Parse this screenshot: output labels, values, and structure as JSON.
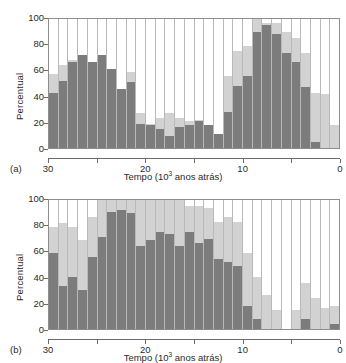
{
  "figure": {
    "panels": [
      {
        "tag": "(a)"
      },
      {
        "tag": "(b)"
      }
    ]
  },
  "axis": {
    "ylabel": "Percentual",
    "yticks": [
      "0",
      "20",
      "40",
      "60",
      "80",
      "100"
    ],
    "xticks": [
      "30",
      "25",
      "20",
      "15",
      "10",
      "5",
      "0"
    ],
    "xtick_labeled": [
      "30",
      "",
      "20",
      "",
      "10",
      "",
      "0"
    ],
    "xlabel_prefix": "Tempo (10",
    "xlabel_sup": "3",
    "xlabel_suffix": " anos atrás)"
  },
  "colors": {
    "dark_gray": "#7c7c7c",
    "light_gray": "#d2d2d2",
    "background": "#ffffff",
    "axis": "#6b6b6b",
    "gridline": "#b9b9b9",
    "frame": "#8d8d8d"
  },
  "chart_data": [
    {
      "type": "bar",
      "panel": "(a)",
      "stacked": true,
      "title": "",
      "xlabel": "Tempo (10^3 anos atrás)",
      "ylabel": "Percentual",
      "ylim": [
        0,
        100
      ],
      "xlim": [
        30,
        0
      ],
      "x_reversed": true,
      "grid": true,
      "bin_width_ka": 1,
      "categories": [
        30,
        29,
        28,
        27,
        26,
        25,
        24,
        23,
        22,
        21,
        20,
        19,
        18,
        17,
        16,
        15,
        14,
        13,
        12,
        11,
        10,
        9,
        8,
        7,
        6,
        5,
        4,
        3,
        2,
        1
      ],
      "series": [
        {
          "name": "dark",
          "values": [
            43,
            52,
            67,
            72,
            67,
            72,
            61,
            46,
            51,
            19,
            18,
            15,
            9,
            16,
            18,
            21,
            18,
            11,
            28,
            48,
            56,
            90,
            95,
            88,
            74,
            67,
            47,
            5,
            0,
            0
          ]
        },
        {
          "name": "light",
          "values": [
            14,
            12,
            1,
            0,
            0,
            0,
            0,
            0,
            8,
            8,
            1,
            8,
            18,
            7,
            3,
            1,
            0,
            0,
            28,
            27,
            23,
            10,
            2,
            9,
            16,
            18,
            27,
            38,
            42,
            18
          ]
        }
      ],
      "totals": [
        57,
        64,
        68,
        72,
        67,
        72,
        61,
        46,
        59,
        27,
        19,
        23,
        27,
        23,
        21,
        22,
        18,
        11,
        56,
        75,
        79,
        100,
        97,
        97,
        90,
        85,
        74,
        43,
        42,
        18
      ]
    },
    {
      "type": "bar",
      "panel": "(b)",
      "stacked": true,
      "title": "",
      "xlabel": "Tempo (10^3 anos atrás)",
      "ylabel": "Percentual",
      "ylim": [
        0,
        100
      ],
      "xlim": [
        30,
        0
      ],
      "x_reversed": true,
      "grid": true,
      "bin_width_ka": 1,
      "categories": [
        30,
        29,
        28,
        27,
        26,
        25,
        24,
        23,
        22,
        21,
        20,
        19,
        18,
        17,
        16,
        15,
        14,
        13,
        12,
        11,
        10,
        9,
        8,
        7,
        6,
        5,
        4,
        3,
        2,
        1
      ],
      "series": [
        {
          "name": "dark",
          "values": [
            59,
            33,
            40,
            30,
            56,
            71,
            91,
            92,
            90,
            64,
            69,
            75,
            74,
            64,
            75,
            67,
            70,
            54,
            52,
            49,
            18,
            8,
            0,
            0,
            0,
            0,
            8,
            0,
            0,
            4
          ]
        },
        {
          "name": "light",
          "values": [
            20,
            49,
            39,
            39,
            31,
            29,
            9,
            8,
            10,
            36,
            31,
            25,
            26,
            36,
            20,
            28,
            24,
            29,
            35,
            34,
            41,
            32,
            26,
            15,
            0,
            15,
            28,
            24,
            16,
            14
          ]
        }
      ],
      "totals": [
        79,
        82,
        79,
        69,
        87,
        100,
        100,
        100,
        100,
        100,
        100,
        100,
        100,
        100,
        95,
        95,
        94,
        83,
        87,
        83,
        59,
        40,
        26,
        15,
        0,
        15,
        36,
        24,
        16,
        18
      ]
    }
  ]
}
